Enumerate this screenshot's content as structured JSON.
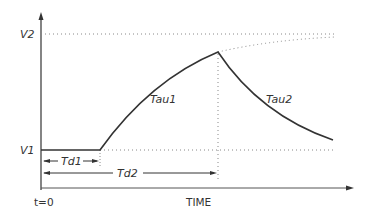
{
  "diagram": {
    "labels": {
      "v2": "V2",
      "v1": "V1",
      "tau1": "Tau1",
      "tau2": "Tau2",
      "td1": "Td1",
      "td2": "Td2",
      "t0": "t=0",
      "time": "TIME"
    },
    "colors": {
      "line": "#333333",
      "dotted": "#888888",
      "background": "#ffffff"
    }
  }
}
